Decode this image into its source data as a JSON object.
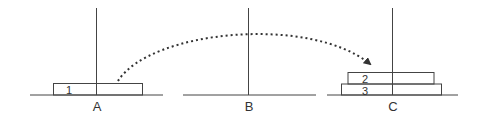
{
  "diagram": {
    "stroke_color": "#444444",
    "pegs": [
      {
        "id": "A",
        "label": "A",
        "disks": [
          {
            "label": "1"
          }
        ]
      },
      {
        "id": "B",
        "label": "B",
        "disks": []
      },
      {
        "id": "C",
        "label": "C",
        "disks": [
          {
            "label": "3"
          },
          {
            "label": "2"
          }
        ]
      }
    ],
    "move_arrow": {
      "from": "A",
      "to": "C",
      "style": "dotted"
    }
  }
}
